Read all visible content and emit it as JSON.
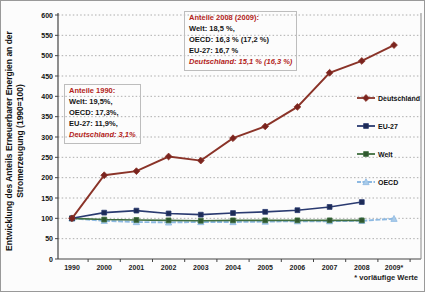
{
  "figure": {
    "ylabel_line1": "Entwicklung des Anteils Erneuerbarer Energien an der",
    "ylabel_line2": "Stromerzeugung (1990=100)",
    "footnote": "* vorläufige Werte"
  },
  "chart_data": {
    "type": "line",
    "title": "",
    "ylabel": "Entwicklung des Anteils Erneuerbarer Energien an der Stromerzeugung (1990=100)",
    "xlabel": "",
    "categories": [
      "1990",
      "2000",
      "2001",
      "2002",
      "2003",
      "2004",
      "2005",
      "2006",
      "2007",
      "2008",
      "2009*"
    ],
    "ylim": [
      0,
      600
    ],
    "ytick_step": 50,
    "grid": "horizontal-dotted",
    "legend_position": "right-inside",
    "footnote": "* vorläufige Werte",
    "series": [
      {
        "name": "Deutschland",
        "color": "#8a3328",
        "marker": "diamond",
        "marker_color": "#7a241f",
        "values": [
          100,
          206,
          216,
          252,
          242,
          297,
          326,
          374,
          458,
          487,
          526
        ]
      },
      {
        "name": "EU-27",
        "color": "#2a3a70",
        "marker": "square",
        "marker_color": "#1d2b56",
        "values": [
          100,
          114,
          119,
          112,
          109,
          113,
          116,
          120,
          128,
          140,
          null
        ]
      },
      {
        "name": "Welt",
        "color": "#3f6e3f",
        "marker": "square",
        "marker_color": "#2f572f",
        "values": [
          100,
          97,
          96,
          95,
          94,
          95,
          95,
          95,
          95,
          95,
          null
        ]
      },
      {
        "name": "OECD",
        "color": "#8db9e2",
        "marker": "triangle",
        "marker_color": "#a9cbe9",
        "values": [
          100,
          94,
          91,
          90,
          91,
          91,
          92,
          93,
          93,
          94,
          99
        ]
      }
    ],
    "annotations": [
      {
        "name": "anteile-1990",
        "lines": [
          {
            "text": "Anteile 1990:",
            "style": "header-red"
          },
          {
            "text": "Welt: 19,5%,",
            "style": "black"
          },
          {
            "text": "OECD: 17,3%,",
            "style": "black"
          },
          {
            "text": "EU-27: 11,9%,",
            "style": "black"
          },
          {
            "text": "Deutschland: 3,1%",
            "style": "red-italic"
          }
        ]
      },
      {
        "name": "anteile-2008-2009",
        "lines": [
          {
            "text": "Anteile 2008 (2009):",
            "style": "header-red"
          },
          {
            "text": "Welt: 18,5 %,",
            "style": "black"
          },
          {
            "text": "OECD: 16,3 % (17,2 %)",
            "style": "black"
          },
          {
            "text": "EU-27: 16,7 %",
            "style": "black"
          },
          {
            "text": "Deutschland: 15,1 % (16,3 %)",
            "style": "red-italic"
          }
        ]
      }
    ]
  }
}
